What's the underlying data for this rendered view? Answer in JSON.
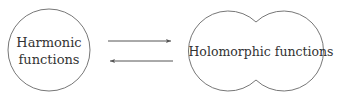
{
  "nodes": {
    "left": {
      "label_line1": "Harmonic",
      "label_line2": "functions"
    },
    "right": {
      "label": "Holomorphic functions"
    }
  },
  "edges": [
    {
      "from": "Harmonic functions",
      "to": "Holomorphic functions"
    },
    {
      "from": "Holomorphic functions",
      "to": "Harmonic functions"
    }
  ],
  "colors": {
    "stroke": "#777777",
    "text": "#333333"
  }
}
